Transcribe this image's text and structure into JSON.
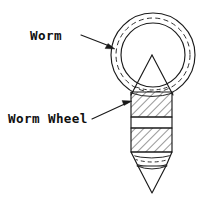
{
  "figure": {
    "background_color": "#ffffff",
    "line_color": "#1a1a1a",
    "width": 207,
    "height": 202
  },
  "labels": {
    "worm": {
      "text": "Worm",
      "x": 30,
      "y": 40
    },
    "worm_wheel": {
      "text": "Worm Wheel",
      "x": 8,
      "y": 123
    }
  },
  "annotations": [
    {
      "name": "worm-leader",
      "label": "Worm",
      "from_x": 81,
      "from_y": 35,
      "to_x": 115,
      "to_y": 49,
      "arrow": "down-right"
    },
    {
      "name": "worm-wheel-leader",
      "label": "Worm Wheel",
      "from_x": 92,
      "from_y": 119,
      "to_x": 132,
      "to_y": 101,
      "arrow": "right-up"
    }
  ],
  "geometry": {
    "worm_ring": {
      "center_x": 153,
      "center_y": 55,
      "outer_radius": 42,
      "pitch_radius": 37,
      "inner_radius": 32,
      "pitch_circle_style": "dashed"
    },
    "cone_top": {
      "apex_x": 152,
      "apex_y": 55,
      "base_left_x": 131,
      "base_right_x": 173,
      "base_y": 97
    },
    "shaft": {
      "left_x": 131,
      "right_x": 172,
      "top_y": 92,
      "bottom_y": 152,
      "bands": [
        {
          "name": "upper-hatched-band",
          "top": 92,
          "bottom": 117,
          "hatched": true
        },
        {
          "name": "middle-blank-band",
          "top": 117,
          "bottom": 128,
          "hatched": false
        },
        {
          "name": "lower-hatched-band",
          "top": 128,
          "bottom": 152,
          "hatched": true
        }
      ],
      "hatch_angle_deg": 45,
      "hatch_spacing": 6
    },
    "taper": {
      "top_y": 152,
      "bottom_y": 166,
      "left_x": 133,
      "right_x": 171,
      "tip_x": 152,
      "tip_y": 193,
      "dashed_arc": true,
      "arc_count": 3
    }
  }
}
